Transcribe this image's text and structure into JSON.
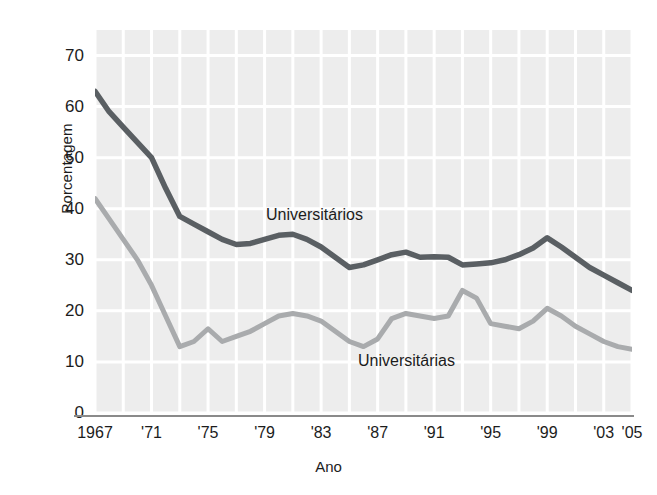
{
  "chart_data": {
    "type": "line",
    "title": "",
    "xlabel": "Ano",
    "ylabel": "Porcentagem",
    "xlim": [
      1967,
      2005
    ],
    "ylim": [
      0,
      75
    ],
    "grid": true,
    "legend_position": "inline-annotation",
    "ytick_labels": [
      "70",
      "60",
      "50",
      "40",
      "30",
      "20",
      "10",
      "0"
    ],
    "ytick_values": [
      70,
      60,
      50,
      40,
      30,
      20,
      10,
      0
    ],
    "xtick_labels": [
      "1967",
      "'71",
      "'75",
      "'79",
      "'83",
      "'87",
      "'91",
      "'95",
      "'99",
      "'03",
      "'05"
    ],
    "xtick_values": [
      1967,
      1971,
      1975,
      1979,
      1983,
      1987,
      1991,
      1995,
      1999,
      2003,
      2005
    ],
    "x": [
      1967,
      1968,
      1969,
      1970,
      1971,
      1972,
      1973,
      1974,
      1975,
      1976,
      1977,
      1978,
      1979,
      1980,
      1981,
      1982,
      1983,
      1984,
      1985,
      1986,
      1987,
      1988,
      1989,
      1990,
      1991,
      1992,
      1993,
      1994,
      1995,
      1996,
      1997,
      1998,
      1999,
      2000,
      2001,
      2002,
      2003,
      2004,
      2005
    ],
    "series": [
      {
        "name": "Universitários",
        "color": "#5a5f63",
        "values": [
          63.0,
          59.0,
          56.0,
          53.0,
          50.0,
          44.0,
          38.5,
          37.0,
          35.5,
          34.0,
          33.0,
          33.2,
          34.0,
          34.8,
          35.0,
          34.0,
          32.5,
          30.5,
          28.5,
          29.0,
          30.0,
          31.0,
          31.5,
          30.5,
          30.6,
          30.5,
          29.0,
          29.2,
          29.4,
          30.0,
          31.0,
          32.3,
          34.3,
          32.5,
          30.5,
          28.5,
          27.0,
          25.5,
          24.0
        ]
      },
      {
        "name": "Universitárias",
        "color": "#a9abad",
        "values": [
          42.0,
          38.0,
          34.0,
          30.0,
          25.0,
          19.0,
          13.0,
          14.0,
          16.5,
          14.0,
          15.0,
          16.0,
          17.5,
          19.0,
          19.5,
          19.0,
          18.0,
          16.0,
          14.0,
          13.0,
          14.5,
          18.5,
          19.5,
          19.0,
          18.5,
          19.0,
          24.0,
          22.5,
          17.5,
          17.0,
          16.5,
          18.0,
          20.5,
          19.0,
          17.0,
          15.5,
          14.0,
          13.0,
          12.5
        ]
      }
    ],
    "annotations": [
      {
        "text": "Universitários",
        "x": 1979,
        "y": 41
      },
      {
        "text": "Universitárias",
        "x": 1987,
        "y": 11
      }
    ]
  },
  "axis": {
    "y_title": "Porcentagem",
    "x_title": "Ano"
  },
  "style": {
    "plot_background": "#ededed",
    "grid_color": "#ffffff",
    "axis_line_color": "#8a8a8a",
    "text_color": "#1c1c1c"
  }
}
